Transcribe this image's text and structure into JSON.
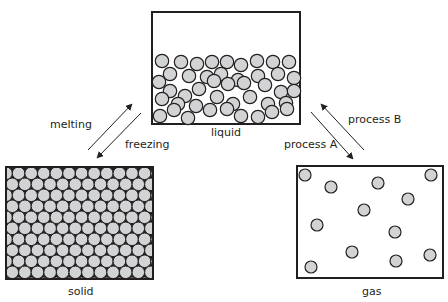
{
  "diagram": {
    "states": [
      {
        "id": "liquid",
        "label": "liquid"
      },
      {
        "id": "solid",
        "label": "solid"
      },
      {
        "id": "gas",
        "label": "gas"
      }
    ],
    "transitions": [
      {
        "label": "melting",
        "from": "solid",
        "to": "liquid"
      },
      {
        "label": "freezing",
        "from": "liquid",
        "to": "solid"
      },
      {
        "label": "process A",
        "from": "liquid",
        "to": "gas"
      },
      {
        "label": "process B",
        "from": "gas",
        "to": "liquid"
      }
    ],
    "colors": {
      "particle_fill": "#d1d3d4",
      "outline": "#231f20",
      "background": "#ffffff"
    }
  }
}
